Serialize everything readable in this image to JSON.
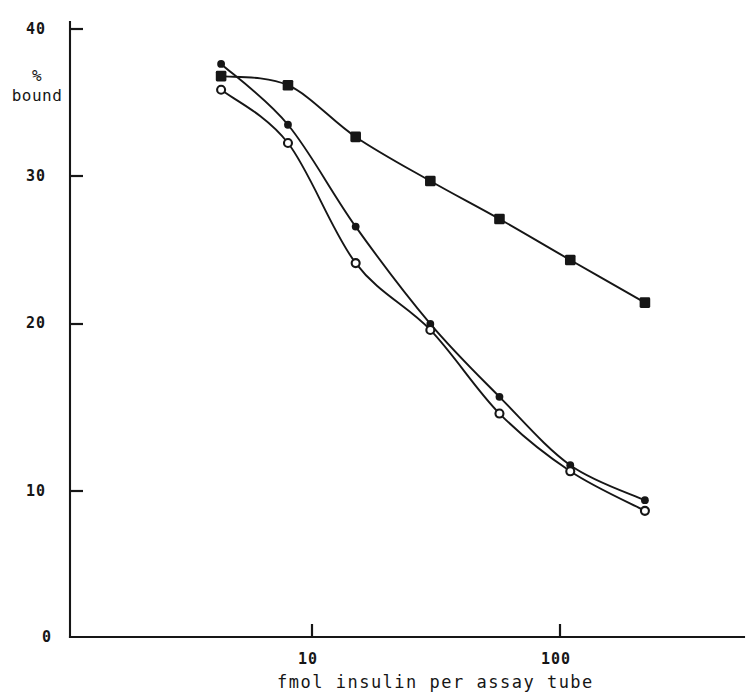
{
  "figure": {
    "background_color": "#ffffff",
    "ink_color": "#161616"
  },
  "axes": {
    "y_axis": {
      "label_line1": "%",
      "label_line2": "bound",
      "ticks": [
        {
          "value": 40,
          "label": "40"
        },
        {
          "value": 30,
          "label": "30"
        },
        {
          "value": 20,
          "label": "20"
        },
        {
          "value": 10,
          "label": "10"
        },
        {
          "value": 0,
          "label": "0"
        }
      ],
      "min": 0,
      "max": 41.5
    },
    "x_axis": {
      "title": "fmol insulin per assay tube",
      "scale": "log10",
      "ticks": [
        {
          "value": 10,
          "label": "10"
        },
        {
          "value": 100,
          "label": "100"
        }
      ],
      "min": 3.3,
      "max": 320
    }
  },
  "chart_data": {
    "type": "line",
    "title": "",
    "subtitle": "",
    "xlabel": "fmol insulin per assay tube",
    "ylabel": "% bound",
    "xscale": "log",
    "xlim": [
      3.3,
      320
    ],
    "ylim": [
      0,
      41.5
    ],
    "grid": false,
    "legend": "none",
    "xticks": [
      10,
      100
    ],
    "xticklabels": [
      "10",
      "100"
    ],
    "yticks": [
      0,
      10,
      20,
      30,
      40
    ],
    "yticklabels": [
      "0",
      "10",
      "20",
      "30",
      "40"
    ],
    "series": [
      {
        "name": "filled-square-series",
        "marker": "filled-square",
        "x": [
          4.3,
          8.0,
          15.0,
          30.0,
          57.0,
          110.0,
          220.0
        ],
        "values": [
          36.9,
          36.3,
          32.9,
          30.0,
          27.5,
          24.8,
          22.0
        ]
      },
      {
        "name": "filled-circle-series",
        "marker": "filled-circle",
        "x": [
          4.3,
          8.0,
          15.0,
          30.0,
          57.0,
          110.0,
          220.0
        ],
        "values": [
          37.7,
          33.7,
          27.0,
          20.6,
          15.8,
          11.3,
          9.0
        ]
      },
      {
        "name": "open-circle-series",
        "marker": "open-circle",
        "x": [
          4.3,
          8.0,
          15.0,
          30.0,
          57.0,
          110.0,
          220.0
        ],
        "values": [
          36.0,
          32.5,
          24.6,
          20.2,
          14.7,
          10.9,
          8.3
        ]
      }
    ]
  }
}
